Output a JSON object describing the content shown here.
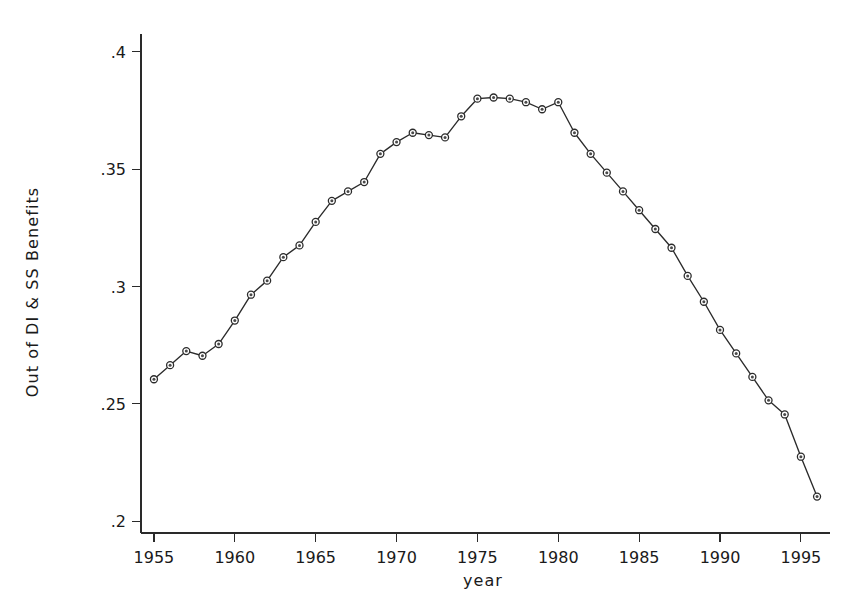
{
  "chart_data": {
    "type": "line",
    "title": "",
    "xlabel": "year",
    "ylabel": "Out of DI & SS Benefits",
    "xlim": [
      1954.2,
      1996.8
    ],
    "ylim": [
      0.195,
      0.405
    ],
    "grid": false,
    "legend": "none",
    "marker": "circle",
    "line_color": "#2b2b2b",
    "xticks": [
      1955,
      1960,
      1965,
      1970,
      1975,
      1980,
      1985,
      1990,
      1995
    ],
    "xtick_labels": [
      "1955",
      "1960",
      "1965",
      "1970",
      "1975",
      "1980",
      "1985",
      "1990",
      "1995"
    ],
    "yticks": [
      0.2,
      0.25,
      0.3,
      0.35,
      0.4
    ],
    "ytick_labels": [
      ".2",
      ".25",
      ".3",
      ".35",
      ".4"
    ],
    "x": [
      1955,
      1956,
      1957,
      1958,
      1959,
      1960,
      1961,
      1962,
      1963,
      1964,
      1965,
      1966,
      1967,
      1968,
      1969,
      1970,
      1971,
      1972,
      1973,
      1974,
      1975,
      1976,
      1977,
      1978,
      1979,
      1980,
      1981,
      1982,
      1983,
      1984,
      1985,
      1986,
      1987,
      1988,
      1989,
      1990,
      1991,
      1992,
      1993,
      1994,
      1995,
      1996
    ],
    "y": [
      0.2605,
      0.2665,
      0.2725,
      0.2705,
      0.2755,
      0.2855,
      0.2965,
      0.3025,
      0.3125,
      0.3175,
      0.3275,
      0.3365,
      0.3405,
      0.3445,
      0.3565,
      0.3615,
      0.3655,
      0.3645,
      0.3635,
      0.3725,
      0.38,
      0.3805,
      0.38,
      0.3785,
      0.3755,
      0.3785,
      0.3655,
      0.3565,
      0.3485,
      0.3405,
      0.3325,
      0.3245,
      0.3165,
      0.3045,
      0.2935,
      0.2815,
      0.2715,
      0.2615,
      0.2515,
      0.2455,
      0.2275,
      0.2105
    ],
    "series": [
      {
        "name": "Out of DI & SS Benefits",
        "values": [
          0.2605,
          0.2665,
          0.2725,
          0.2705,
          0.2755,
          0.2855,
          0.2965,
          0.3025,
          0.3125,
          0.3175,
          0.3275,
          0.3365,
          0.3405,
          0.3445,
          0.3565,
          0.3615,
          0.3655,
          0.3645,
          0.3635,
          0.3725,
          0.38,
          0.3805,
          0.38,
          0.3785,
          0.3755,
          0.3785,
          0.3655,
          0.3565,
          0.3485,
          0.3405,
          0.3325,
          0.3245,
          0.3165,
          0.3045,
          0.2935,
          0.2815,
          0.2715,
          0.2615,
          0.2515,
          0.2455,
          0.2275,
          0.2105
        ]
      }
    ]
  }
}
